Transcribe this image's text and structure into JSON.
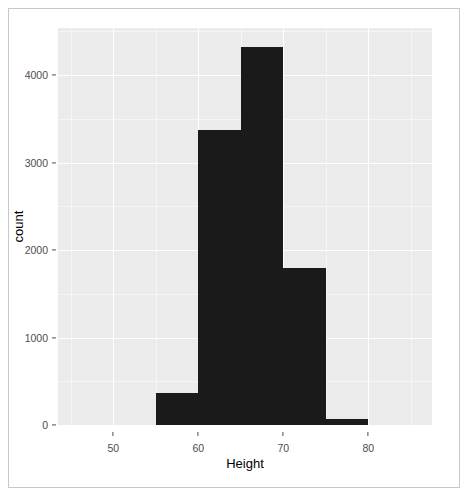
{
  "chart_data": {
    "type": "bar",
    "title": "",
    "subtitle": "",
    "xlabel": "Height",
    "ylabel": "count",
    "categories": [
      "55-60",
      "60-65",
      "65-70",
      "70-75",
      "75-80"
    ],
    "bin_edges": [
      55,
      60,
      65,
      70,
      75,
      80
    ],
    "bin_width": 5,
    "values": [
      366,
      3371,
      4320,
      1794,
      69
    ],
    "series": [
      {
        "name": "count",
        "values": [
          366,
          3371,
          4320,
          1794,
          69
        ]
      }
    ],
    "xlim": [
      43.5,
      87.5
    ],
    "ylim": [
      0,
      4540
    ],
    "x_ticks": [
      50,
      60,
      70,
      80
    ],
    "x_tick_labels": [
      "50",
      "60",
      "70",
      "80"
    ],
    "y_ticks": [
      0,
      1000,
      2000,
      3000,
      4000
    ],
    "y_tick_labels": [
      "0",
      "1000",
      "2000",
      "3000",
      "4000"
    ],
    "grid": true,
    "legend": "none",
    "bar_color": "#1a1a1a",
    "panel_color": "#ebebeb",
    "grid_color": "#ffffff",
    "axis_text_color": "#4d4d4d",
    "figure_border_color": "#c8c8c8",
    "annotations": []
  }
}
